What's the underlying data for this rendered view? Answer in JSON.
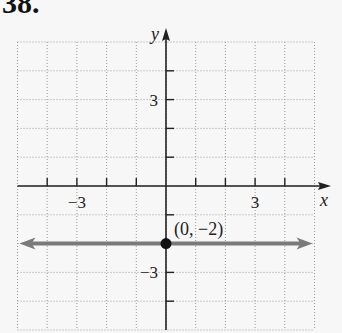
{
  "exercise_label": "38.",
  "chart_data": {
    "type": "line",
    "title": "",
    "xlabel": "x",
    "ylabel": "y",
    "xlim": [
      -5,
      5
    ],
    "ylim": [
      -5,
      5
    ],
    "grid": true,
    "grid_style": "dotted",
    "x_tick_labels": [
      {
        "value": -3,
        "label": "−3"
      },
      {
        "value": 3,
        "label": "3"
      }
    ],
    "y_tick_labels": [
      {
        "value": 3,
        "label": "3"
      },
      {
        "value": -3,
        "label": "−3"
      }
    ],
    "series": [
      {
        "name": "y = -2",
        "equation": "y = -2",
        "x": [
          -5,
          5
        ],
        "y": [
          -2,
          -2
        ],
        "color": "#7a7a7a",
        "arrows": "both"
      }
    ],
    "points": [
      {
        "x": 0,
        "y": -2,
        "label": "(0, −2)",
        "color": "#111111"
      }
    ]
  },
  "colors": {
    "axis": "#222222",
    "grid": "#9a9a9a",
    "line": "#7a7a7a",
    "point": "#111111"
  }
}
